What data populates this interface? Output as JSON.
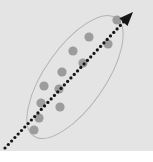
{
  "figure": {
    "title": "",
    "caption": "",
    "watermark": "",
    "panel_color": "#e4e4e4",
    "background_color": "#ffffff"
  },
  "chart_data": {
    "type": "scatter",
    "title": "",
    "subtitle": "",
    "xlabel": "",
    "ylabel": "",
    "xlim": [
      0,
      153
    ],
    "ylim": [
      0,
      151
    ],
    "grid": false,
    "legend": null,
    "relationship": "positive correlation",
    "point_color": "#9c9c9c",
    "point_radius": 4.6,
    "points": [
      {
        "x": 117,
        "y": 20
      },
      {
        "x": 108,
        "y": 44
      },
      {
        "x": 89,
        "y": 37
      },
      {
        "x": 73,
        "y": 51
      },
      {
        "x": 83,
        "y": 63
      },
      {
        "x": 62,
        "y": 72
      },
      {
        "x": 44,
        "y": 86
      },
      {
        "x": 59,
        "y": 89
      },
      {
        "x": 41,
        "y": 103
      },
      {
        "x": 60,
        "y": 107
      },
      {
        "x": 39,
        "y": 118
      },
      {
        "x": 34,
        "y": 130
      }
    ],
    "ellipse": {
      "cx": 75,
      "cy": 77,
      "rx": 30,
      "ry": 72,
      "rotation_deg": 35,
      "stroke": "#b4b4b4",
      "stroke_width": 1,
      "fill": "none"
    },
    "trend_arrow": {
      "x1": 5,
      "y1": 148,
      "x2": 133,
      "y2": 12,
      "style": "dotted",
      "color": "#151515",
      "dot_size": 2.6,
      "arrowhead": "filled-triangle",
      "direction": "up-right"
    }
  }
}
